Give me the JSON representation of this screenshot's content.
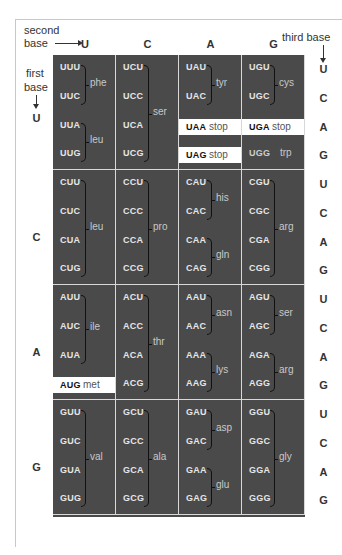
{
  "labels": {
    "second_base": [
      "second",
      "base"
    ],
    "third_base": "third base",
    "first_base": [
      "first",
      "base"
    ]
  },
  "second_bases": [
    "U",
    "C",
    "A",
    "G"
  ],
  "first_bases": [
    "U",
    "C",
    "A",
    "G"
  ],
  "third_bases": [
    "U",
    "C",
    "A",
    "G"
  ],
  "colors": {
    "cell_bg": "#4a4a4a",
    "grid_line": "#d8d8d8",
    "codon_text": "#e6e6e6",
    "aa_text": "#c8c8c8",
    "highlight_bg": "#ffffff"
  },
  "table": [
    [
      {
        "codons": [
          "UUU",
          "UUC",
          "UUA",
          "UUG"
        ],
        "groups": [
          {
            "aa": "phe",
            "from": 0,
            "to": 1
          },
          {
            "aa": "leu",
            "from": 2,
            "to": 3
          }
        ]
      },
      {
        "codons": [
          "UCU",
          "UCC",
          "UCA",
          "UCG"
        ],
        "groups": [
          {
            "aa": "ser",
            "from": 0,
            "to": 3
          }
        ]
      },
      {
        "codons": [
          "UAU",
          "UAC",
          "UAA",
          "UAG"
        ],
        "groups": [
          {
            "aa": "tyr",
            "from": 0,
            "to": 1
          }
        ],
        "special": [
          {
            "row": 2,
            "codon": "UAA",
            "aa": "stop"
          },
          {
            "row": 3,
            "codon": "UAG",
            "aa": "stop"
          }
        ]
      },
      {
        "codons": [
          "UGU",
          "UGC",
          "UGA",
          "UGG"
        ],
        "groups": [
          {
            "aa": "cys",
            "from": 0,
            "to": 1
          }
        ],
        "special": [
          {
            "row": 2,
            "codon": "UGA",
            "aa": "stop"
          }
        ],
        "single": [
          {
            "row": 3,
            "codon": "UGG",
            "aa": "trp"
          }
        ]
      }
    ],
    [
      {
        "codons": [
          "CUU",
          "CUC",
          "CUA",
          "CUG"
        ],
        "groups": [
          {
            "aa": "leu",
            "from": 0,
            "to": 3
          }
        ]
      },
      {
        "codons": [
          "CCU",
          "CCC",
          "CCA",
          "CCG"
        ],
        "groups": [
          {
            "aa": "pro",
            "from": 0,
            "to": 3
          }
        ]
      },
      {
        "codons": [
          "CAU",
          "CAC",
          "CAA",
          "CAG"
        ],
        "groups": [
          {
            "aa": "his",
            "from": 0,
            "to": 1
          },
          {
            "aa": "gln",
            "from": 2,
            "to": 3
          }
        ]
      },
      {
        "codons": [
          "CGU",
          "CGC",
          "CGA",
          "CGG"
        ],
        "groups": [
          {
            "aa": "arg",
            "from": 0,
            "to": 3
          }
        ]
      }
    ],
    [
      {
        "codons": [
          "AUU",
          "AUC",
          "AUA",
          "AUG"
        ],
        "groups": [
          {
            "aa": "ile",
            "from": 0,
            "to": 2
          }
        ],
        "special": [
          {
            "row": 3,
            "codon": "AUG",
            "aa": "met"
          }
        ]
      },
      {
        "codons": [
          "ACU",
          "ACC",
          "ACA",
          "ACG"
        ],
        "groups": [
          {
            "aa": "thr",
            "from": 0,
            "to": 3
          }
        ]
      },
      {
        "codons": [
          "AAU",
          "AAC",
          "AAA",
          "AAG"
        ],
        "groups": [
          {
            "aa": "asn",
            "from": 0,
            "to": 1
          },
          {
            "aa": "lys",
            "from": 2,
            "to": 3
          }
        ]
      },
      {
        "codons": [
          "AGU",
          "AGC",
          "AGA",
          "AGG"
        ],
        "groups": [
          {
            "aa": "ser",
            "from": 0,
            "to": 1
          },
          {
            "aa": "arg",
            "from": 2,
            "to": 3
          }
        ]
      }
    ],
    [
      {
        "codons": [
          "GUU",
          "GUC",
          "GUA",
          "GUG"
        ],
        "groups": [
          {
            "aa": "val",
            "from": 0,
            "to": 3
          }
        ]
      },
      {
        "codons": [
          "GCU",
          "GCC",
          "GCA",
          "GCG"
        ],
        "groups": [
          {
            "aa": "ala",
            "from": 0,
            "to": 3
          }
        ]
      },
      {
        "codons": [
          "GAU",
          "GAC",
          "GAA",
          "GAG"
        ],
        "groups": [
          {
            "aa": "asp",
            "from": 0,
            "to": 1
          },
          {
            "aa": "glu",
            "from": 2,
            "to": 3
          }
        ]
      },
      {
        "codons": [
          "GGU",
          "GGC",
          "GGA",
          "GGG"
        ],
        "groups": [
          {
            "aa": "gly",
            "from": 0,
            "to": 3
          }
        ]
      }
    ]
  ]
}
